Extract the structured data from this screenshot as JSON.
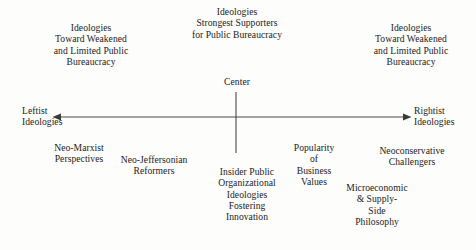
{
  "diagram": {
    "background_color": "#fdfdfb",
    "text_color": "#1c1c1c",
    "line_color": "#3a3a3a",
    "axis": {
      "center_label": "Center",
      "left_pole_label": "Leftist\nIdeologies",
      "right_pole_label": "Rightist\nIdeologies",
      "horizontal": {
        "x1": 52,
        "x2": 412,
        "y": 117
      },
      "vertical": {
        "x": 236,
        "y1": 92,
        "y2": 153
      }
    },
    "top_labels": {
      "top_left": "Ideologies\nToward Weakened\nand Limited Public\nBureaucracy",
      "top_center": "Ideologies\nStrongest Supporters\nfor Public Bureaucracy",
      "top_right": "Ideologies\nToward Weakened\nand Limited Public\nBureaucracy"
    },
    "bottom_labels": [
      {
        "name": "neo-marxist-perspectives",
        "text": "Neo-Marxist\nPerspectives"
      },
      {
        "name": "neo-jeffersonian-reformers",
        "text": "Neo-Jeffersonian\nReformers"
      },
      {
        "name": "insider-public-organizational-ideologies",
        "text": "Insider Public\nOrganizational\nIdeologies\nFostering\nInnovation"
      },
      {
        "name": "popularity-of-business-values",
        "text": "Popularity\nof\nBusiness\nValues"
      },
      {
        "name": "neoconservative-challengers",
        "text": "Neoconservative\nChallengers"
      },
      {
        "name": "microeconomic-supply-side-philosophy",
        "text": "Microeconomic\n& Supply-\nSide\nPhilosophy"
      }
    ]
  }
}
